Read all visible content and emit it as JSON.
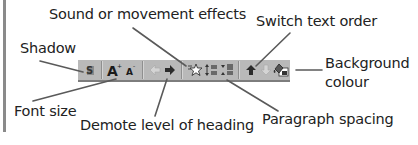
{
  "diagram": {
    "labels": {
      "shadow": "Shadow",
      "sound_effects": "Sound or movement effects",
      "switch_text_order": "Switch text order",
      "background_colour_line1": "Background",
      "background_colour_line2": "colour",
      "font_size": "Font size",
      "demote_heading": "Demote level of heading",
      "paragraph_spacing": "Paragraph spacing"
    },
    "toolbar": {
      "buttons": [
        {
          "name": "shadow",
          "icon": "shadow-icon",
          "glyph": "S"
        },
        {
          "name": "increase-font-size",
          "icon": "increase-font-icon",
          "glyph": "A"
        },
        {
          "name": "decrease-font-size",
          "icon": "decrease-font-icon",
          "glyph": "A"
        },
        {
          "name": "promote",
          "icon": "promote-arrow-icon",
          "glyph": "⇦"
        },
        {
          "name": "demote",
          "icon": "demote-arrow-icon",
          "glyph": "➜"
        },
        {
          "name": "animation-effects",
          "icon": "star-effects-icon",
          "glyph": "☆"
        },
        {
          "name": "increase-paragraph-spacing",
          "icon": "paragraph-spacing-up-icon",
          "glyph": "≡"
        },
        {
          "name": "decrease-paragraph-spacing",
          "icon": "paragraph-spacing-down-icon",
          "glyph": "≡"
        },
        {
          "name": "move-up",
          "icon": "move-up-arrow-icon",
          "glyph": "⬆"
        },
        {
          "name": "move-down",
          "icon": "move-down-arrow-icon",
          "glyph": "⇩"
        },
        {
          "name": "background-colour",
          "icon": "paint-bucket-icon",
          "glyph": "🖌"
        }
      ]
    },
    "colors": {
      "toolbar_bg": "#b9b9b9",
      "leader_line": "#5a5a5a",
      "frame_line": "#8a8a8a"
    }
  }
}
